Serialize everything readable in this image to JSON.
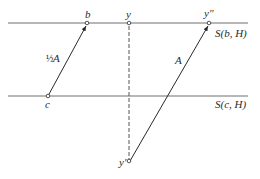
{
  "diagram": {
    "lines": [
      {
        "id": "top",
        "label": "S(b, H)"
      },
      {
        "id": "bottom",
        "label": "S(c, H)"
      }
    ],
    "points": {
      "b": "b",
      "y": "y",
      "y_double_prime": "y″",
      "c": "c",
      "y_prime": "y′"
    },
    "vectors": [
      {
        "from": "c",
        "to": "b",
        "label_coeff": "½",
        "label_var": "A"
      },
      {
        "from": "y_prime",
        "to": "y_double_prime",
        "label_var": "A"
      }
    ],
    "dashed": {
      "from": "y",
      "to": "y_prime"
    }
  }
}
